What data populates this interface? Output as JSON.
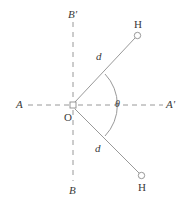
{
  "figure": {
    "background_color": "#ffffff",
    "line_color": "#8d8d8d",
    "text_color": "#3a3a3a",
    "width": 186,
    "height": 201
  },
  "axes": {
    "horizontal": {
      "name": "A-A'",
      "left_label": "A",
      "right_label": "A'",
      "style": "dashed"
    },
    "vertical": {
      "name": "B-B'",
      "top_label": "B'",
      "bottom_label": "B",
      "style": "dashed"
    }
  },
  "origin": {
    "label": "O",
    "marker": "open-square"
  },
  "atoms": [
    {
      "label": "H",
      "position": "upper-right",
      "marker": "open-circle"
    },
    {
      "label": "H",
      "position": "lower-right",
      "marker": "open-circle"
    }
  ],
  "bonds": [
    {
      "label": "d",
      "from": "O",
      "to": "H-upper"
    },
    {
      "label": "d",
      "from": "O",
      "to": "H-lower"
    }
  ],
  "angle": {
    "label": "θ",
    "marker": "arc",
    "between": "the two O–H bonds"
  },
  "geometry": {
    "origin_x": 73,
    "origin_y": 105,
    "h_upper_x": 138,
    "h_upper_y": 35,
    "h_lower_x": 142,
    "h_lower_y": 176,
    "axis_left_x": 28,
    "axis_right_x": 163,
    "axis_top_y": 22,
    "axis_bottom_y": 181,
    "arc_radius": 44
  }
}
